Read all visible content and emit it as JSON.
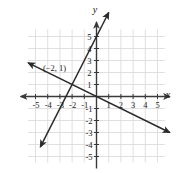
{
  "figure": {
    "kind": "coordinate-plane-graph",
    "background_color": "#ffffff",
    "grid_color": "#d8d8dc",
    "axis_color": "#3a3a3a",
    "line_color": "#2b2b2b",
    "text_color": "#1a1a1a"
  },
  "axes": {
    "x_name": "x",
    "y_name": "y",
    "x_ticks": [
      "-5",
      "-4",
      "-3",
      "-2",
      "-1",
      "1",
      "2",
      "3",
      "4",
      "5"
    ],
    "y_ticks": [
      "5",
      "4",
      "3",
      "2",
      "1",
      "-1",
      "-2",
      "-3",
      "-4",
      "-5"
    ],
    "x_labels_negative": [
      "-5",
      "-4",
      "-3",
      "-2",
      "-1"
    ],
    "x_labels_positive": [
      "1",
      "2",
      "3",
      "4",
      "5"
    ],
    "y_labels_positive": [
      "5",
      "4",
      "3",
      "2",
      "1"
    ],
    "y_labels_negative": [
      "-1",
      "-2",
      "-3",
      "-4",
      "-5"
    ]
  },
  "annotations": {
    "intersection_label": "(−2, 1)"
  },
  "chart_data": {
    "type": "line",
    "title": "",
    "xlabel": "x",
    "ylabel": "y",
    "xlim": [
      -6.2,
      6.2
    ],
    "ylim": [
      -5.8,
      6.2
    ],
    "grid": true,
    "grid_step": 1,
    "legend": "none",
    "annotations": [
      {
        "text": "(−2, 1)",
        "x": -2,
        "y": 1,
        "describes": "intersection point of the two lines"
      }
    ],
    "series": [
      {
        "name": "steep-positive-slope-line",
        "slope": 2,
        "intercept": 5,
        "equation": "y = 2x + 5",
        "x": [
          -4.6,
          1.0
        ],
        "y": [
          -4.2,
          7.0
        ],
        "arrows": "both",
        "color": "#2b2b2b"
      },
      {
        "name": "shallow-negative-slope-line",
        "slope": -0.5,
        "intercept": 0,
        "equation": "y = -0.5x",
        "x": [
          -5.6,
          6.0
        ],
        "y": [
          2.8,
          -3.0
        ],
        "arrows": "both",
        "color": "#2b2b2b"
      }
    ],
    "x_ticks": [
      -5,
      -4,
      -3,
      -2,
      -1,
      1,
      2,
      3,
      4,
      5
    ],
    "y_ticks": [
      -5,
      -4,
      -3,
      -2,
      -1,
      1,
      2,
      3,
      4,
      5
    ]
  }
}
